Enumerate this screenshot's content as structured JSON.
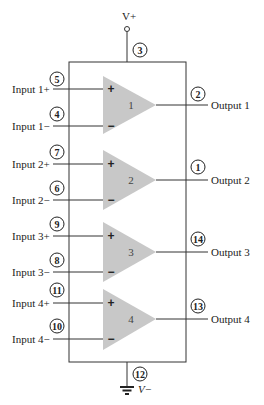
{
  "diagram": {
    "supply": {
      "vplus_label": "V+",
      "vplus_pin": "3",
      "vminus_label": "V−",
      "vminus_pin": "12"
    },
    "amplifiers": [
      {
        "number": "1",
        "plus_sign": "+",
        "minus_sign": "−",
        "input_plus_label": "Input 1+",
        "input_plus_pin": "5",
        "input_minus_label": "Input 1−",
        "input_minus_pin": "4",
        "output_label": "Output 1",
        "output_pin": "2"
      },
      {
        "number": "2",
        "plus_sign": "+",
        "minus_sign": "−",
        "input_plus_label": "Input 2+",
        "input_plus_pin": "7",
        "input_minus_label": "Input 2−",
        "input_minus_pin": "6",
        "output_label": "Output 2",
        "output_pin": "1"
      },
      {
        "number": "3",
        "plus_sign": "+",
        "minus_sign": "−",
        "input_plus_label": "Input 3+",
        "input_plus_pin": "9",
        "input_minus_label": "Input 3−",
        "input_minus_pin": "8",
        "output_label": "Output 3",
        "output_pin": "14"
      },
      {
        "number": "4",
        "plus_sign": "+",
        "minus_sign": "−",
        "input_plus_label": "Input 4+",
        "input_plus_pin": "11",
        "input_minus_label": "Input 4−",
        "input_minus_pin": "10",
        "output_label": "Output 4",
        "output_pin": "13"
      }
    ],
    "colors": {
      "triangle_fill": "#c8c8c8",
      "wire": "#333333",
      "background": "#ffffff"
    }
  }
}
